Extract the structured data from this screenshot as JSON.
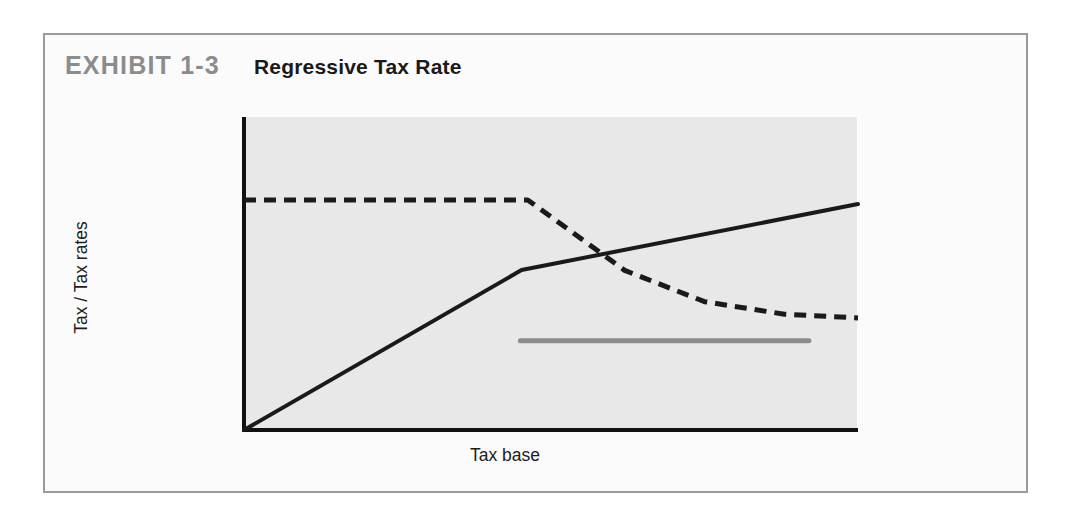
{
  "exhibit": {
    "number": "EXHIBIT 1-3",
    "title": "Regressive Tax Rate"
  },
  "chart_data": {
    "type": "line",
    "title": "Regressive Tax Rate",
    "xlabel": "Tax base",
    "ylabel": "Tax / Tax rates",
    "grid": false,
    "legend_position": "inline-annotations",
    "axes": {
      "x_ticks": [],
      "y_ticks": [],
      "xlim": [
        0,
        100
      ],
      "ylim": [
        0,
        100
      ],
      "plot_background": "#e8e8e8",
      "axis_color": "#111111"
    },
    "series": [
      {
        "name": "Total tax",
        "style": "solid",
        "color": "#1a1a1a",
        "width": 4,
        "label": "Total tax",
        "label_position": "upper-right",
        "points": [
          {
            "x": 0,
            "y": 0
          },
          {
            "x": 45.2,
            "y": 51.1
          },
          {
            "x": 100,
            "y": 72.2
          }
        ],
        "description": "Total tax rises steeply then flattens to a gentler slope as the tax base grows."
      },
      {
        "name": "Average tax rate",
        "style": "dashed",
        "color": "#1a1a1a",
        "width": 5,
        "dash": "12 8",
        "label": "Average tax rate",
        "label_position": "right",
        "secondary_label": "Marginal tax rate",
        "secondary_label_position": "upper-left",
        "points": [
          {
            "x": 0,
            "y": 73.5
          },
          {
            "x": 46.2,
            "y": 73.5
          },
          {
            "x": 62.0,
            "y": 51.0
          },
          {
            "x": 75.0,
            "y": 41.0
          },
          {
            "x": 88.0,
            "y": 37.0
          },
          {
            "x": 100,
            "y": 35.8
          }
        ],
        "description": "Flat at the top over low tax bases, then falls and levels off — the hallmark of a regressive average rate."
      },
      {
        "name": "Marginal tax rate",
        "style": "solid",
        "color": "#8c8c8c",
        "width": 5,
        "label": "Marginal tax rate",
        "label_position": "below-center",
        "points": [
          {
            "x": 45.0,
            "y": 28.5
          },
          {
            "x": 92.0,
            "y": 28.5
          }
        ],
        "description": "Constant lower marginal rate applying beyond the threshold."
      }
    ],
    "annotations": [
      {
        "text": "Marginal tax rate",
        "x": 4,
        "y": 82,
        "anchor": "left"
      },
      {
        "text": "Total tax",
        "x": 76,
        "y": 77,
        "anchor": "left"
      },
      {
        "text": "Average tax rate",
        "x": 67,
        "y": 47,
        "anchor": "left"
      },
      {
        "text": "Marginal tax rate",
        "x": 47,
        "y": 21,
        "anchor": "left"
      }
    ]
  }
}
